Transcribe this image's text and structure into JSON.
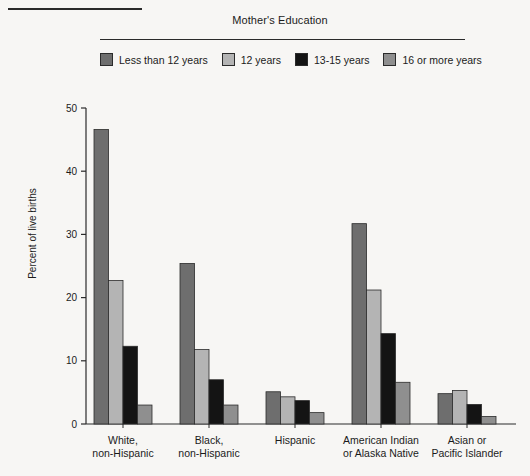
{
  "legend": {
    "title": "Mother's Education",
    "items": [
      {
        "label": "Less than 12 years",
        "color": "#6e6e6e"
      },
      {
        "label": "12 years",
        "color": "#b4b4b4"
      },
      {
        "label": "13-15 years",
        "color": "#141414"
      },
      {
        "label": "16 or more years",
        "color": "#8f8f8f"
      }
    ]
  },
  "axis": {
    "ylabel": "Percent of live births",
    "yticks": [
      "0",
      "10",
      "20",
      "30",
      "40",
      "50"
    ]
  },
  "chart_data": {
    "type": "bar",
    "title": "Mother's Education",
    "xlabel": "",
    "ylabel": "Percent of live births",
    "ylim": [
      0,
      50
    ],
    "grid": false,
    "legend_position": "top",
    "categories": [
      "White,\nnon-Hispanic",
      "Black,\nnon-Hispanic",
      "Hispanic",
      "American Indian\nor Alaska Native",
      "Asian or\nPacific Islander"
    ],
    "category_lines": [
      [
        "White,",
        "non-Hispanic"
      ],
      [
        "Black,",
        "non-Hispanic"
      ],
      [
        "Hispanic",
        ""
      ],
      [
        "American Indian",
        "or Alaska Native"
      ],
      [
        "Asian or",
        "Pacific Islander"
      ]
    ],
    "series": [
      {
        "name": "Less than 12 years",
        "color": "#6e6e6e",
        "values": [
          46.6,
          25.4,
          5.1,
          31.7,
          4.8
        ]
      },
      {
        "name": "12 years",
        "color": "#b4b4b4",
        "values": [
          22.7,
          11.8,
          4.3,
          21.2,
          5.3
        ]
      },
      {
        "name": "13-15 years",
        "color": "#141414",
        "values": [
          12.3,
          7.0,
          3.7,
          14.3,
          3.1
        ]
      },
      {
        "name": "16 or more years",
        "color": "#8f8f8f",
        "values": [
          3.0,
          3.0,
          1.8,
          6.6,
          1.2
        ]
      }
    ]
  }
}
